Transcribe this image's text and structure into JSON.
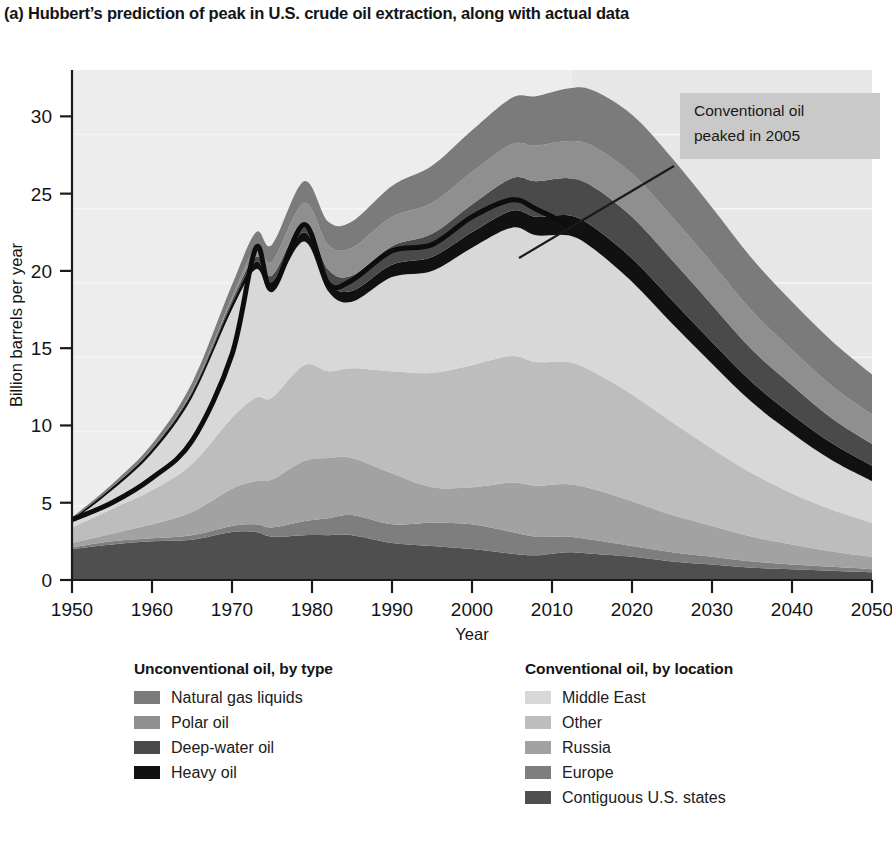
{
  "figure": {
    "label": "(a)",
    "title": "(a) Hubbert’s prediction of peak in U.S. crude oil extraction, along with actual data"
  },
  "annotation": {
    "line1": "Conventional oil",
    "line2": "peaked in 2005",
    "box_fill": "#c9c9c9"
  },
  "legend_unconventional": {
    "heading": "Unconventional oil, by type",
    "items": [
      {
        "label": "Natural gas liquids",
        "color": "#7b7b7b"
      },
      {
        "label": "Polar oil",
        "color": "#8f8f8f"
      },
      {
        "label": "Deep-water oil",
        "color": "#4a4a4a"
      },
      {
        "label": "Heavy oil",
        "color": "#111111"
      }
    ]
  },
  "legend_conventional": {
    "heading": "Conventional oil, by location",
    "items": [
      {
        "label": "Middle East",
        "color": "#d8d8d8"
      },
      {
        "label": "Other",
        "color": "#bdbdbd"
      },
      {
        "label": "Russia",
        "color": "#a2a2a2"
      },
      {
        "label": "Europe",
        "color": "#7e7e7e"
      },
      {
        "label": "Contiguous U.S. states",
        "color": "#4f4f4f"
      }
    ]
  },
  "chart_data": {
    "type": "area",
    "title": "(a) Hubbert’s prediction of peak in U.S. crude oil extraction, along with actual data",
    "xlabel": "Year",
    "ylabel": "Billion barrels per year",
    "xlim": [
      1950,
      2050
    ],
    "ylim": [
      0,
      33
    ],
    "xticks": [
      1950,
      1960,
      1970,
      1980,
      1990,
      2000,
      2010,
      2020,
      2030,
      2040,
      2050
    ],
    "yticks": [
      0,
      5,
      10,
      15,
      20,
      25,
      30
    ],
    "grid": "horizontal-faint",
    "legend_position": "below-plot",
    "projection_start_year": 2012,
    "projection_shading": "#e9e9e9",
    "plot_background": "#ededed",
    "annotations": [
      {
        "text": "Conventional oil peaked in 2005",
        "point_year": 2005,
        "point_value": 24.6
      }
    ],
    "stack_order_bottom_to_top": [
      "Contiguous U.S. states",
      "Europe",
      "Russia",
      "Other",
      "Middle East",
      "Heavy oil",
      "Deep-water oil",
      "Polar oil",
      "Natural gas liquids"
    ],
    "x": [
      1950,
      1955,
      1960,
      1965,
      1970,
      1973,
      1975,
      1979,
      1982,
      1985,
      1990,
      1995,
      2000,
      2005,
      2008,
      2012,
      2015,
      2020,
      2025,
      2030,
      2035,
      2040,
      2045,
      2050
    ],
    "series": [
      {
        "name": "Contiguous U.S. states",
        "color": "#4f4f4f",
        "values": [
          2.0,
          2.3,
          2.5,
          2.6,
          3.1,
          3.1,
          2.8,
          2.9,
          2.9,
          2.9,
          2.4,
          2.2,
          2.0,
          1.7,
          1.6,
          1.8,
          1.7,
          1.5,
          1.2,
          1.0,
          0.8,
          0.7,
          0.6,
          0.5
        ]
      },
      {
        "name": "Europe",
        "color": "#7e7e7e",
        "values": [
          0.1,
          0.2,
          0.2,
          0.3,
          0.4,
          0.5,
          0.6,
          0.9,
          1.1,
          1.3,
          1.2,
          1.5,
          1.6,
          1.4,
          1.2,
          1.0,
          0.9,
          0.7,
          0.6,
          0.5,
          0.4,
          0.3,
          0.25,
          0.2
        ]
      },
      {
        "name": "Russia",
        "color": "#a2a2a2",
        "values": [
          0.3,
          0.5,
          0.9,
          1.5,
          2.4,
          2.8,
          3.1,
          3.9,
          3.9,
          3.7,
          3.3,
          2.3,
          2.4,
          3.2,
          3.3,
          3.4,
          3.3,
          2.9,
          2.4,
          2.0,
          1.6,
          1.3,
          1.0,
          0.8
        ]
      },
      {
        "name": "Other",
        "color": "#bdbdbd",
        "values": [
          1.0,
          1.6,
          2.2,
          3.1,
          4.6,
          5.4,
          5.3,
          6.2,
          5.6,
          5.8,
          6.6,
          7.4,
          7.9,
          8.2,
          8.0,
          7.9,
          7.6,
          6.9,
          6.0,
          5.0,
          4.1,
          3.3,
          2.7,
          2.2
        ]
      },
      {
        "name": "Middle East",
        "color": "#d8d8d8",
        "values": [
          0.4,
          1.2,
          2.4,
          4.3,
          7.0,
          8.3,
          7.0,
          8.0,
          5.2,
          4.3,
          6.1,
          6.6,
          7.6,
          8.3,
          8.2,
          8.2,
          8.0,
          7.3,
          6.4,
          5.5,
          4.6,
          3.9,
          3.2,
          2.7
        ]
      },
      {
        "name": "Heavy oil",
        "color": "#111111",
        "values": [
          0.15,
          0.2,
          0.25,
          0.3,
          0.4,
          0.5,
          0.5,
          0.6,
          0.6,
          0.7,
          0.8,
          0.9,
          1.0,
          1.1,
          1.2,
          1.3,
          1.4,
          1.5,
          1.5,
          1.4,
          1.3,
          1.2,
          1.1,
          1.0
        ]
      },
      {
        "name": "Deep-water oil",
        "color": "#4a4a4a",
        "values": [
          0.0,
          0.0,
          0.05,
          0.1,
          0.2,
          0.3,
          0.4,
          0.6,
          0.8,
          1.0,
          1.2,
          1.5,
          1.8,
          2.1,
          2.3,
          2.4,
          2.6,
          2.7,
          2.6,
          2.4,
          2.1,
          1.9,
          1.6,
          1.4
        ]
      },
      {
        "name": "Polar oil",
        "color": "#8f8f8f",
        "values": [
          0.0,
          0.0,
          0.0,
          0.05,
          0.2,
          0.6,
          0.9,
          1.3,
          1.6,
          1.8,
          1.9,
          2.0,
          2.1,
          2.2,
          2.3,
          2.4,
          2.6,
          2.8,
          2.8,
          2.7,
          2.5,
          2.3,
          2.1,
          1.9
        ]
      },
      {
        "name": "Natural gas liquids",
        "color": "#7b7b7b",
        "values": [
          0.1,
          0.2,
          0.3,
          0.5,
          0.8,
          1.0,
          1.1,
          1.4,
          1.5,
          1.7,
          2.0,
          2.4,
          2.7,
          3.0,
          3.2,
          3.4,
          3.6,
          3.8,
          3.8,
          3.6,
          3.4,
          3.1,
          2.9,
          2.6
        ]
      }
    ],
    "hubbert_curve": {
      "name": "Hubbert prediction (black line)",
      "color": "#0d0d0d",
      "x": [
        1950,
        1955,
        1960,
        1965,
        1970,
        1973,
        1975,
        1979,
        1982,
        1985,
        1990,
        1995,
        2000,
        2005,
        2008,
        2012
      ],
      "y": [
        3.9,
        5.0,
        6.6,
        9.0,
        14.6,
        21.5,
        18.8,
        23.0,
        19.2,
        19.4,
        21.3,
        21.7,
        23.5,
        24.6,
        24.0,
        23.0
      ]
    }
  }
}
